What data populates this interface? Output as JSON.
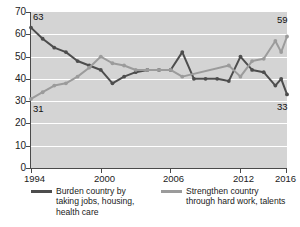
{
  "chart_data": {
    "type": "line",
    "title": "",
    "xlabel": "",
    "ylabel": "",
    "xlim": [
      1994,
      2016
    ],
    "ylim": [
      0,
      70
    ],
    "ytick_step": 10,
    "yticks": [
      0,
      10,
      20,
      30,
      40,
      50,
      60,
      70
    ],
    "xticks": [
      1994,
      2000,
      2006,
      2012,
      2016
    ],
    "grid": true,
    "grid_color": "#ffffff",
    "plot_background": "#d4d4d4",
    "legend_position": "bottom",
    "endpoint_labels": [
      {
        "text": "63",
        "series": "burden",
        "x": 1994,
        "y": 63
      },
      {
        "text": "31",
        "series": "strengthen",
        "x": 1994,
        "y": 31
      },
      {
        "text": "59",
        "series": "strengthen",
        "x": 2016,
        "y": 59
      },
      {
        "text": "33",
        "series": "burden",
        "x": 2016,
        "y": 33
      }
    ],
    "series": [
      {
        "name": "Burden country by taking jobs, housing, health care",
        "short_name": "burden",
        "color": "#4d4d4d",
        "x": [
          1994,
          1995,
          1996,
          1997,
          1998,
          1999,
          2000,
          2001,
          2002,
          2003,
          2004,
          2005,
          2006,
          2007,
          2008,
          2009,
          2010,
          2011,
          2012,
          2013,
          2014,
          2015,
          2015.5,
          2016
        ],
        "values": [
          63,
          58,
          54,
          52,
          48,
          46,
          44,
          38,
          41,
          43,
          44,
          44,
          44,
          52,
          40,
          40,
          40,
          39,
          50,
          44,
          43,
          37,
          40,
          33
        ]
      },
      {
        "name": "Strengthen country through hard work, talents",
        "short_name": "strengthen",
        "color": "#9b9b9b",
        "x": [
          1994,
          1995,
          1996,
          1997,
          1998,
          1999,
          2000,
          2001,
          2002,
          2003,
          2004,
          2005,
          2006,
          2007,
          2011,
          2012,
          2013,
          2014,
          2015,
          2015.5,
          2016
        ],
        "values": [
          31,
          34,
          37,
          38,
          41,
          45,
          50,
          47,
          46,
          44,
          44,
          44,
          44,
          41,
          46,
          41,
          48,
          49,
          57,
          52,
          59
        ]
      }
    ]
  },
  "axis": {
    "y_labels": [
      "70",
      "60",
      "50",
      "40",
      "30",
      "20",
      "10",
      "0"
    ],
    "x_labels": [
      "1994",
      "2000",
      "2006",
      "2012",
      "2016"
    ]
  },
  "legend": {
    "items": [
      {
        "label": "Burden country by taking jobs, housing, health care",
        "color": "#4d4d4d"
      },
      {
        "label": "Strengthen country through hard work, talents",
        "color": "#9b9b9b"
      }
    ]
  },
  "values": {
    "start_burden": "63",
    "start_strengthen": "31",
    "end_strengthen": "59",
    "end_burden": "33"
  }
}
